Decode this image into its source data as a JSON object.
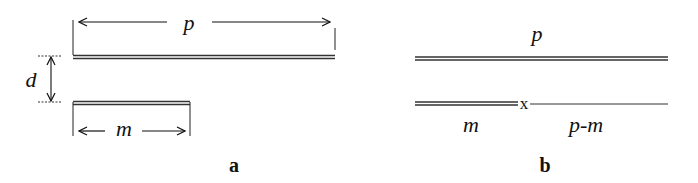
{
  "diagram": {
    "panel_a": {
      "caption": "a",
      "top_strand_length_label": "p",
      "bottom_strand_length_label": "m",
      "separation_label": "d"
    },
    "panel_b": {
      "caption": "b",
      "top_strand_label": "p",
      "bottom_left_label": "m",
      "bottom_right_label": "p-m",
      "junction_marker": "x"
    },
    "colors": {
      "ink": "#111111",
      "background": "#ffffff"
    }
  }
}
